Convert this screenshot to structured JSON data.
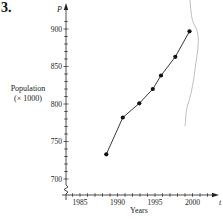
{
  "problem_number": "3.",
  "chart_data": {
    "type": "line",
    "title": "",
    "xlabel": "Years",
    "ylabel_line1": "Population",
    "ylabel_line2": "(× 1000)",
    "x_axis_symbol": "t",
    "y_axis_symbol": "P",
    "x_ticks": [
      1985,
      1990,
      1995,
      2000
    ],
    "y_ticks": [
      700,
      750,
      800,
      850,
      900
    ],
    "xlim": [
      1983,
      2003
    ],
    "ylim": [
      680,
      920
    ],
    "grid": false,
    "legend": null,
    "axis_break": "y-axis zigzag near origin",
    "series": [
      {
        "name": "Population",
        "marker": "filled-circle",
        "x": [
          1988.5,
          1990.7,
          1992.9,
          1994.7,
          1995.8,
          1997.7,
          1999.6
        ],
        "y": [
          733,
          782,
          801,
          820,
          838,
          863,
          897
        ]
      }
    ]
  },
  "colors": {
    "line": "#222222",
    "marker": "#111111",
    "axis": "#222222",
    "scan_artifact": "#b8b8b8"
  }
}
